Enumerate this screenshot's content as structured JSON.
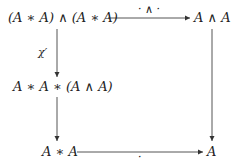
{
  "diagram": {
    "type": "commutative-square",
    "nodes": {
      "top_left": "(A ∗ A) ∧ (A ∗ A)",
      "top_right": "A ∧ A",
      "middle_left": "A ∗ A ∗ (A ∧ A)",
      "bottom_left": "A ∗ A",
      "bottom_right": "A"
    },
    "arrows": {
      "top": {
        "from": "top_left",
        "to": "top_right",
        "label": "· ∧ ·"
      },
      "left_upper": {
        "from": "top_left",
        "to": "middle_left",
        "label": "χ′"
      },
      "left_lower": {
        "from": "middle_left",
        "to": "bottom_left",
        "label": ""
      },
      "right": {
        "from": "top_right",
        "to": "bottom_right",
        "label": ""
      },
      "bottom": {
        "from": "bottom_left",
        "to": "bottom_right",
        "label": "·"
      }
    }
  }
}
